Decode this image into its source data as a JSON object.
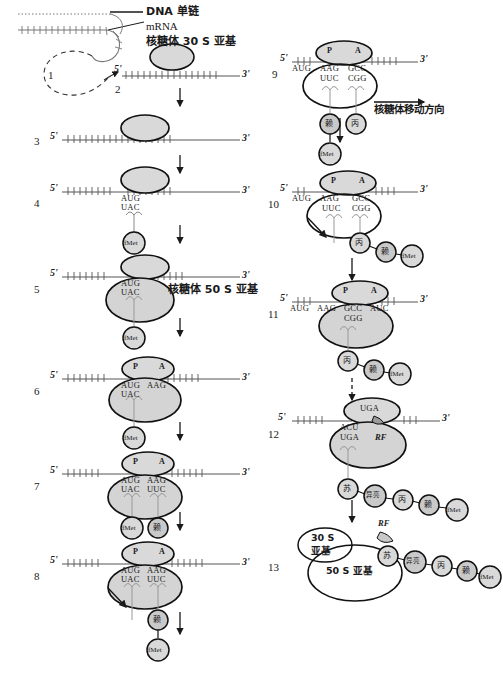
{
  "figure": {
    "type": "diagram",
    "legend": {
      "dna_strand": "DNA 单链",
      "mrna": "mRNA",
      "small_subunit": "核糖体 30 S 亚基",
      "large_subunit": "核糖体 50 S 亚基",
      "movement": "核糖体移动方向"
    },
    "prime_five": "5'",
    "prime_three": "3'",
    "sites": {
      "p": "P",
      "a": "A"
    },
    "release_factor": "RF",
    "subunits": {
      "small": "30 S\n亚基",
      "small_line1": "30 S",
      "small_line2": "亚基",
      "large": "50 S 亚基"
    },
    "amino_acids": {
      "fmet": "fMet",
      "lys": "赖",
      "ala": "丙",
      "thr": "苏",
      "ile": "异亮"
    },
    "steps": [
      {
        "num": "1",
        "note": "DNA 单链环"
      },
      {
        "num": "2",
        "note": "mRNA 5' 端"
      },
      {
        "num": "3",
        "note": "30S 亚基结合 mRNA"
      },
      {
        "num": "4",
        "codons": [
          "AUG"
        ],
        "anticodons": [
          "UAC"
        ],
        "tRNA": [
          "fMet"
        ]
      },
      {
        "num": "5",
        "codons": [
          "AUG"
        ],
        "anticodons": [
          "UAC"
        ],
        "tRNA": [
          "fMet"
        ]
      },
      {
        "num": "6",
        "codons": [
          "AUG",
          "AAG"
        ],
        "anticodons": [
          "UAC"
        ],
        "tRNA": [
          "fMet"
        ]
      },
      {
        "num": "7",
        "codons": [
          "AUG",
          "AAG"
        ],
        "anticodons": [
          "UAC",
          "UUC"
        ],
        "tRNA": [
          "fMet",
          "赖"
        ]
      },
      {
        "num": "8",
        "codons": [
          "AUG",
          "AAG"
        ],
        "anticodons": [
          "UAC",
          "UUC"
        ],
        "tRNA": [
          "赖",
          "fMet"
        ]
      },
      {
        "num": "9",
        "codons": [
          "AUG",
          "AAG",
          "GCC"
        ],
        "anticodons": [
          "UUC",
          "CGG"
        ],
        "tRNA": [
          "赖",
          "丙",
          "fMet"
        ]
      },
      {
        "num": "10",
        "codons": [
          "AUG",
          "AAG",
          "GCC"
        ],
        "anticodons": [
          "UUC",
          "CGG"
        ],
        "tRNA": [
          "丙",
          "赖",
          "fMet"
        ]
      },
      {
        "num": "11",
        "codons": [
          "AUG",
          "AAG",
          "GCC",
          "AUC"
        ],
        "anticodons": [
          "CGG"
        ],
        "tRNA": [
          "丙",
          "赖",
          "fMet"
        ]
      },
      {
        "num": "12",
        "codons": [
          "UGA",
          "ACU"
        ],
        "anticodons": [
          "UGA"
        ],
        "factor": "RF",
        "tRNA": [
          "苏",
          "异亮",
          "丙",
          "赖",
          "fMet"
        ]
      },
      {
        "num": "13",
        "factor": "RF",
        "tRNA": [
          "苏",
          "异亮",
          "丙",
          "赖",
          "fMet"
        ]
      }
    ]
  },
  "colors": {
    "fill_subunit": "#d9d9d9",
    "fill_small": "#dcdcdc",
    "stroke": "#1a1a1a",
    "mrna": "#555555",
    "aa_fill": "#d0d0d0"
  }
}
